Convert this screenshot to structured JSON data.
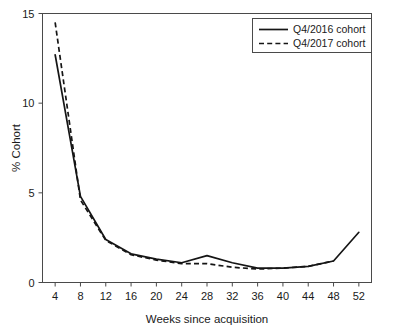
{
  "chart_data": {
    "type": "line",
    "title": "",
    "xlabel": "Weeks since acquisition",
    "ylabel": "% Cohort",
    "x": [
      4,
      8,
      12,
      16,
      20,
      24,
      28,
      32,
      36,
      40,
      44,
      48,
      52
    ],
    "xticklabels": [
      "4",
      "8",
      "12",
      "16",
      "20",
      "24",
      "28",
      "32",
      "36",
      "40",
      "44",
      "48",
      "52"
    ],
    "yticklabels": [
      "0",
      "5",
      "10",
      "15"
    ],
    "yticks": [
      0,
      5,
      10,
      15
    ],
    "xlim": [
      2,
      54
    ],
    "ylim": [
      0,
      15
    ],
    "grid": false,
    "legend_position": "top-right",
    "series": [
      {
        "name": "Q4/2016 cohort",
        "style": "solid",
        "color": "#151515",
        "x": [
          4,
          8,
          12,
          16,
          20,
          24,
          28,
          32,
          36,
          40,
          44,
          48,
          52
        ],
        "values": [
          12.7,
          4.8,
          2.4,
          1.6,
          1.3,
          1.1,
          1.5,
          1.1,
          0.8,
          0.8,
          0.9,
          1.2,
          2.8
        ]
      },
      {
        "name": "Q4/2017 cohort",
        "style": "dashed",
        "color": "#151515",
        "x": [
          4,
          8,
          12,
          16,
          20,
          24,
          28,
          32,
          36,
          40,
          44,
          48
        ],
        "values": [
          14.5,
          4.6,
          2.35,
          1.55,
          1.25,
          1.05,
          1.05,
          0.85,
          0.75,
          0.8,
          0.9,
          1.2
        ]
      }
    ]
  },
  "legend": {
    "entries": [
      {
        "label": "Q4/2016 cohort",
        "style": "solid"
      },
      {
        "label": "Q4/2017 cohort",
        "style": "dashed"
      }
    ]
  }
}
